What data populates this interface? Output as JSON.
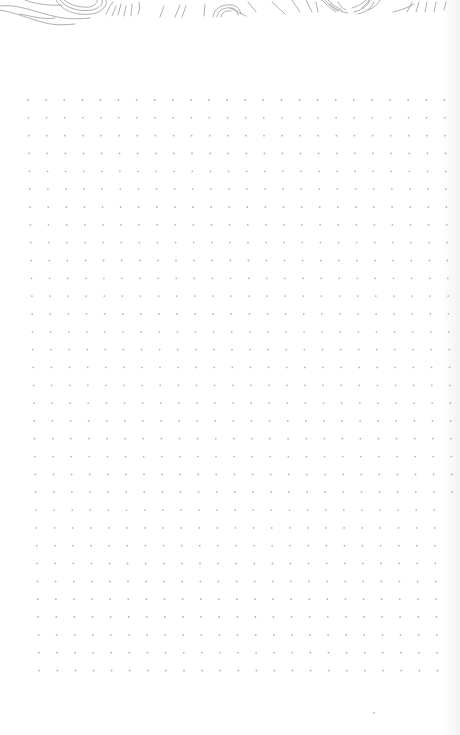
{
  "page": {
    "type": "dotted-notebook-page",
    "background_color": "#ffffff",
    "edge_shade_color": "#f3f3f3"
  },
  "header_art": {
    "description": "topographic contour line doodle",
    "stroke_color": "#9a9a9a"
  },
  "dot_grid": {
    "dot_color": "#b5b5b5",
    "dot_radius": 0.9,
    "origin_x": 28,
    "origin_y": 100,
    "spacing": 18.1,
    "columns": 24,
    "rows": 33
  },
  "stray_dot": {
    "x": 373,
    "y": 712,
    "color": "#c4c4c4"
  }
}
